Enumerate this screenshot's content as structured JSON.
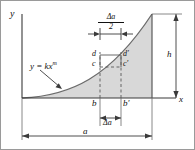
{
  "figure": {
    "axes": {
      "x_label": "x",
      "y_label": "y"
    },
    "curve": {
      "equation": "y = kx",
      "exponent": "m",
      "callout": "y = kx^m"
    },
    "dimensions": [
      {
        "name": "half-step",
        "numerator": "Δa",
        "denominator": "2",
        "position": "top"
      },
      {
        "name": "step",
        "label": "Δa",
        "position": "bottom-inner"
      },
      {
        "name": "total-width",
        "label": "a",
        "position": "bottom-outer"
      },
      {
        "name": "total-height",
        "label": "h",
        "position": "right"
      }
    ],
    "points": [
      {
        "id": "b",
        "label": "b",
        "position": "baseline-left"
      },
      {
        "id": "bp",
        "label": "b′",
        "position": "baseline-right"
      },
      {
        "id": "c",
        "label": "c",
        "position": "element-lower-left"
      },
      {
        "id": "d",
        "label": "d",
        "position": "element-upper-left"
      },
      {
        "id": "cp",
        "label": "c′",
        "position": "element-lower-right"
      },
      {
        "id": "dp",
        "label": "d′",
        "position": "element-upper-right"
      }
    ],
    "colors": {
      "fill": "#d8d8d8",
      "stroke": "#4a4a4a",
      "axis": "#3a3a3a",
      "dashed": "#5a5a5a",
      "border": "#8c8c8c",
      "text": "#111111"
    }
  }
}
